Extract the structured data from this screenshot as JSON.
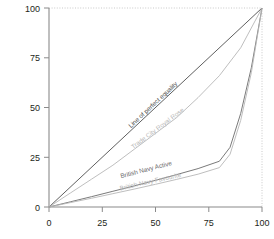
{
  "chart_data": {
    "type": "line",
    "title": "",
    "xlabel": "",
    "ylabel": "Cumulative share of income (%)",
    "xlim": [
      0,
      100
    ],
    "ylim": [
      0,
      100
    ],
    "xticks": [
      0,
      25,
      50,
      75,
      100
    ],
    "yticks": [
      0,
      25,
      50,
      75,
      100
    ],
    "xtick_labels": [
      "0",
      "25",
      "50",
      "75",
      "100"
    ],
    "ytick_labels": [
      "0",
      "25",
      "50",
      "75",
      "100"
    ],
    "grid": false,
    "legend_position": "inline-annotations",
    "series": [
      {
        "name": "Line of perfect equality",
        "label": "Line of perfect equality",
        "color": "#4d4d4d",
        "x": [
          0,
          100
        ],
        "y": [
          0,
          100
        ],
        "annotation_x": 50,
        "annotation_y": 50
      },
      {
        "name": "Trade City Royal Rose",
        "label": "Trade City Royal Rose",
        "color": "#b7b7b7",
        "x": [
          0,
          10,
          20,
          30,
          40,
          50,
          60,
          70,
          80,
          90,
          100
        ],
        "y": [
          0,
          7,
          14,
          21,
          29,
          37,
          45,
          55,
          66,
          80,
          100
        ],
        "annotation_x": 52,
        "annotation_y": 38
      },
      {
        "name": "British Navy Active",
        "label": "British Navy Active",
        "color": "#6b6b6b",
        "x": [
          0,
          10,
          20,
          30,
          40,
          50,
          60,
          70,
          80,
          85,
          90,
          95,
          100
        ],
        "y": [
          0,
          2.6,
          5.2,
          7.9,
          10.6,
          13.4,
          16.3,
          19.3,
          23.0,
          30.0,
          47.0,
          70.0,
          100
        ],
        "annotation_x": 46,
        "annotation_y": 17
      },
      {
        "name": "British Navy Favourite",
        "label": "British Navy Favourite",
        "color": "#b7b7b7",
        "x": [
          0,
          10,
          20,
          30,
          40,
          50,
          60,
          70,
          80,
          85,
          90,
          95,
          100
        ],
        "y": [
          0,
          2.2,
          4.4,
          6.7,
          9.0,
          11.4,
          13.9,
          16.5,
          19.8,
          26.5,
          43.5,
          67.5,
          100
        ],
        "annotation_x": 48,
        "annotation_y": 11
      }
    ]
  },
  "axes": {
    "y_axis_title": "Cumulative share of income (%)"
  }
}
